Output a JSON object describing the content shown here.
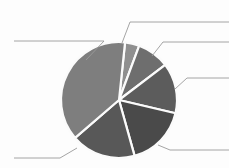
{
  "chart_data": {
    "type": "pie",
    "title": "",
    "subtitle": "",
    "xlabel": "",
    "ylabel": "",
    "legend_position": "none",
    "grid": false,
    "labels_visible": false,
    "start_angle_deg": -84,
    "direction": "clockwise",
    "center_px": [
      119,
      100
    ],
    "radius_px": 58,
    "categories": [
      "Slice 1",
      "Slice 2",
      "Slice 3",
      "Slice 4",
      "Slice 5",
      "Slice 6"
    ],
    "values": [
      4,
      9,
      14,
      17,
      18,
      38
    ],
    "percentages": [
      4,
      9,
      14,
      17,
      18,
      38
    ],
    "colors": [
      "#8f8f8f",
      "#6e6e6e",
      "#5c5c5c",
      "#4a4a4a",
      "#585858",
      "#7e7e7e"
    ],
    "annotations": [],
    "leader_lines": [
      {
        "name": "leader-top-left",
        "points": "86,60 104,41 14,41",
        "label": ""
      },
      {
        "name": "leader-top-right",
        "points": "122,43 130,22 229,22",
        "label": ""
      },
      {
        "name": "leader-upper-right",
        "points": "152,56 163,42 229,42",
        "label": ""
      },
      {
        "name": "leader-right",
        "points": "175,89 187,78 229,78",
        "label": ""
      },
      {
        "name": "leader-bottom-right",
        "points": "158,145 170,150 229,150",
        "label": ""
      },
      {
        "name": "leader-bottom-left",
        "points": "77,148 60,158 14,158",
        "label": ""
      }
    ]
  },
  "meta": {
    "background_color": "#fdfdfd",
    "separator_color": "#fbfbfb",
    "leader_color": "#9a9a9a"
  }
}
